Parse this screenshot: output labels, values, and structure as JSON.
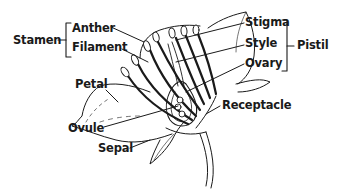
{
  "diagram": {
    "type": "flower-anatomy",
    "groups": {
      "stamen": {
        "label": "Stamen",
        "parts": [
          "Anther",
          "Filament"
        ]
      },
      "pistil": {
        "label": "Pistil",
        "parts": [
          "Stigma",
          "Style",
          "Ovary"
        ]
      }
    },
    "labels": {
      "stamen": "Stamen",
      "anther": "Anther",
      "filament": "Filament",
      "petal": "Petal",
      "ovule": "Ovule",
      "sepal": "Sepal",
      "stigma": "Stigma",
      "style": "Style",
      "ovary": "Ovary",
      "pistil": "Pistil",
      "receptacle": "Receptacle"
    },
    "colors": {
      "ink": "#1a1a1a",
      "background": "#ffffff"
    }
  }
}
